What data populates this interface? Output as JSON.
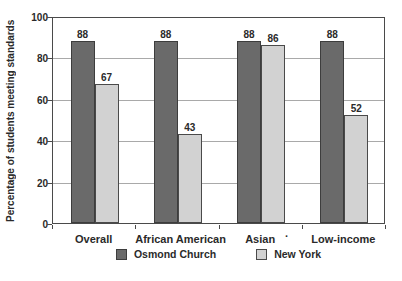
{
  "chart_data": {
    "type": "bar",
    "categories": [
      "Overall",
      "African American",
      "Asian",
      "Low-income"
    ],
    "series": [
      {
        "name": "Osmond Church",
        "values": [
          88,
          88,
          88,
          88
        ],
        "fill": "#6a6a6a",
        "border": "#3d3d3d"
      },
      {
        "name": "New York",
        "values": [
          67,
          43,
          86,
          52
        ],
        "fill": "#d2d2d2",
        "border": "#4a4a4a"
      }
    ],
    "title": "",
    "xlabel": "",
    "ylabel": "Percentage of students meeting standards",
    "ylim": [
      0,
      100
    ],
    "yticks": [
      0,
      20,
      40,
      60,
      80,
      100
    ],
    "grid": "horizontal",
    "legend_position": "bottom",
    "stray_mark": ".",
    "colors": {
      "frame": "#4a4a4a",
      "gridline": "#a9a9a9",
      "text": "#2a2a2a",
      "background": "#ffffff"
    }
  }
}
